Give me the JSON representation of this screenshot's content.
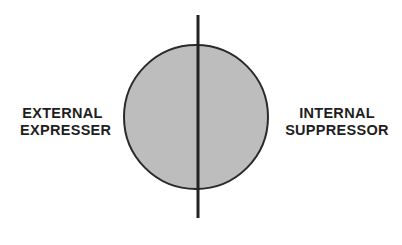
{
  "diagram": {
    "left_label": {
      "line1": "EXTERNAL",
      "line2": "EXPRESSER"
    },
    "right_label": {
      "line1": "INTERNAL",
      "line2": "SUPPRESSOR"
    },
    "circle": {
      "cx": 196,
      "cy": 117,
      "r": 72,
      "fill": "#bdbdbd",
      "stroke": "#2a2a2a"
    },
    "divider_line": {
      "x": 198,
      "y1": 15,
      "y2": 218,
      "color": "#222222"
    }
  }
}
